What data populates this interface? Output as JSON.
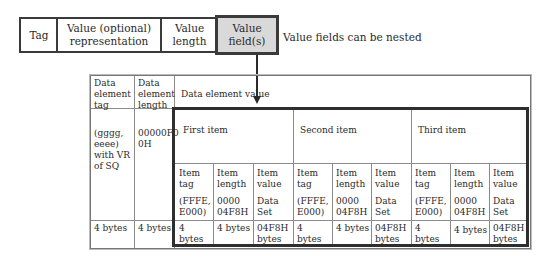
{
  "top_row": {
    "fields": [
      {
        "label": "Tag"
      },
      {
        "label": "Value (optional) representation"
      },
      {
        "label": "Value length"
      },
      {
        "label": "Value field(s)",
        "highlighted": true
      }
    ],
    "note": "Value fields can be nested"
  },
  "table": {
    "headers": {
      "tag": "Data element tag",
      "length": "Data element length",
      "value": "Data element value"
    },
    "tag_value": "(gggg, eeee) with VR of SQ",
    "length_value": "00000F0 0H",
    "items": [
      {
        "title": "First item"
      },
      {
        "title": "Second item"
      },
      {
        "title": "Third item"
      }
    ],
    "sub_columns": [
      {
        "header": "Item tag",
        "value": "(FFFE, E000)",
        "size": "4 bytes"
      },
      {
        "header": "Item length",
        "value": "0000 04F8H",
        "size": "4 bytes"
      },
      {
        "header": "Item value",
        "value": "Data Set",
        "size": "04F8H bytes"
      }
    ],
    "tag_size": "4 bytes",
    "length_size": "4 bytes"
  },
  "colors": {
    "line": "#3a3a3a",
    "highlight_fill": "#d9d9d9",
    "thick_border": "#2e2e2e"
  }
}
